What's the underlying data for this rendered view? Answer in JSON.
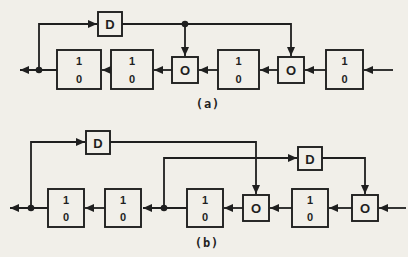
{
  "figure": {
    "bg_color": "#f1efe9",
    "ink_color": "#1f1f1f",
    "diagrams": [
      {
        "id": "diagram-a",
        "label": "(a)",
        "label_pos": {
          "x": 208,
          "y": 104
        },
        "cells": [
          {
            "x": 57,
            "y": 50,
            "w": 44,
            "h": 39,
            "top": "1",
            "bottom": "0"
          },
          {
            "x": 111,
            "y": 50,
            "w": 42,
            "h": 39,
            "top": "1",
            "bottom": "0"
          },
          {
            "x": 218,
            "y": 50,
            "w": 41,
            "h": 39,
            "top": "1",
            "bottom": "0"
          },
          {
            "x": 326,
            "y": 50,
            "w": 37,
            "h": 39,
            "top": "1",
            "bottom": "0"
          }
        ],
        "adders": [
          {
            "x": 172,
            "y": 57,
            "w": 26,
            "h": 26,
            "label": "O"
          },
          {
            "x": 278,
            "y": 57,
            "w": 26,
            "h": 26,
            "label": "O"
          }
        ],
        "delays": [
          {
            "x": 98,
            "y": 12,
            "w": 24,
            "h": 24,
            "label": "D"
          }
        ],
        "dots": [
          {
            "x": 39,
            "y": 70
          },
          {
            "x": 185,
            "y": 24
          }
        ],
        "wires": [
          {
            "points": [
              [
                393,
                70
              ],
              [
                364,
                70
              ]
            ]
          },
          {
            "points": [
              [
                326,
                70
              ],
              [
                305,
                70
              ]
            ]
          },
          {
            "points": [
              [
                278,
                70
              ],
              [
                260,
                70
              ]
            ]
          },
          {
            "points": [
              [
                218,
                70
              ],
              [
                199,
                70
              ]
            ]
          },
          {
            "points": [
              [
                172,
                70
              ],
              [
                154,
                70
              ]
            ]
          },
          {
            "points": [
              [
                111,
                70
              ],
              [
                102,
                70
              ]
            ]
          },
          {
            "points": [
              [
                57,
                70
              ],
              [
                20,
                70
              ]
            ]
          },
          {
            "points": [
              [
                39,
                70
              ],
              [
                39,
                24
              ],
              [
                97,
                24
              ]
            ]
          },
          {
            "points": [
              [
                122,
                24
              ],
              [
                291,
                24
              ],
              [
                291,
                56
              ]
            ]
          },
          {
            "points": [
              [
                185,
                24
              ],
              [
                185,
                56
              ]
            ]
          }
        ]
      },
      {
        "id": "diagram-b",
        "label": "(b)",
        "label_pos": {
          "x": 207,
          "y": 243
        },
        "cells": [
          {
            "x": 48,
            "y": 189,
            "w": 36,
            "h": 38,
            "top": "1",
            "bottom": "0"
          },
          {
            "x": 105,
            "y": 189,
            "w": 36,
            "h": 38,
            "top": "1",
            "bottom": "0"
          },
          {
            "x": 187,
            "y": 189,
            "w": 36,
            "h": 38,
            "top": "1",
            "bottom": "0"
          },
          {
            "x": 292,
            "y": 189,
            "w": 36,
            "h": 38,
            "top": "1",
            "bottom": "0"
          }
        ],
        "adders": [
          {
            "x": 243,
            "y": 195,
            "w": 26,
            "h": 26,
            "label": "O"
          },
          {
            "x": 352,
            "y": 195,
            "w": 26,
            "h": 26,
            "label": "O"
          }
        ],
        "delays": [
          {
            "x": 86,
            "y": 131,
            "w": 24,
            "h": 23,
            "label": "D"
          },
          {
            "x": 298,
            "y": 147,
            "w": 24,
            "h": 23,
            "label": "D"
          }
        ],
        "dots": [
          {
            "x": 31,
            "y": 208
          },
          {
            "x": 164,
            "y": 208
          }
        ],
        "wires": [
          {
            "points": [
              [
                406,
                208
              ],
              [
                379,
                208
              ]
            ]
          },
          {
            "points": [
              [
                352,
                208
              ],
              [
                329,
                208
              ]
            ]
          },
          {
            "points": [
              [
                292,
                208
              ],
              [
                270,
                208
              ]
            ]
          },
          {
            "points": [
              [
                243,
                208
              ],
              [
                224,
                208
              ]
            ]
          },
          {
            "points": [
              [
                187,
                208
              ],
              [
                143,
                208
              ]
            ]
          },
          {
            "points": [
              [
                105,
                208
              ],
              [
                85,
                208
              ]
            ]
          },
          {
            "points": [
              [
                48,
                208
              ],
              [
                10,
                208
              ]
            ]
          },
          {
            "points": [
              [
                31,
                208
              ],
              [
                31,
                142
              ],
              [
                85,
                142
              ]
            ]
          },
          {
            "points": [
              [
                110,
                142
              ],
              [
                256,
                142
              ],
              [
                256,
                194
              ]
            ]
          },
          {
            "points": [
              [
                164,
                208
              ],
              [
                164,
                158
              ],
              [
                297,
                158
              ]
            ]
          },
          {
            "points": [
              [
                322,
                158
              ],
              [
                365,
                158
              ],
              [
                365,
                194
              ]
            ]
          }
        ]
      }
    ]
  }
}
